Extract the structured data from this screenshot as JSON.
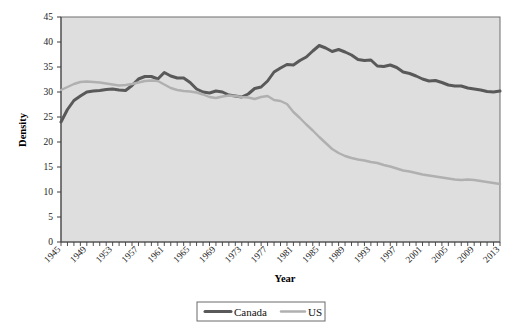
{
  "chart_data": {
    "type": "line",
    "title": "",
    "xlabel": "Year",
    "ylabel": "Density",
    "xlim": [
      1945,
      2013
    ],
    "ylim": [
      0,
      45
    ],
    "yticks": [
      0,
      5,
      10,
      15,
      20,
      25,
      30,
      35,
      40,
      45
    ],
    "xtick_labels": [
      "1945",
      "1949",
      "1953",
      "1957",
      "1961",
      "1965",
      "1969",
      "1973",
      "1977",
      "1981",
      "1985",
      "1989",
      "1993",
      "1997",
      "2001",
      "2005",
      "2009",
      "2013"
    ],
    "xtick_values": [
      1945,
      1949,
      1953,
      1957,
      1961,
      1965,
      1969,
      1973,
      1977,
      1981,
      1985,
      1989,
      1993,
      1997,
      2001,
      2005,
      2009,
      2013
    ],
    "grid": false,
    "legend_position": "bottom",
    "plot_background": "#dedede",
    "x": [
      1945,
      1946,
      1947,
      1948,
      1949,
      1950,
      1951,
      1952,
      1953,
      1954,
      1955,
      1956,
      1957,
      1958,
      1959,
      1960,
      1961,
      1962,
      1963,
      1964,
      1965,
      1966,
      1967,
      1968,
      1969,
      1970,
      1971,
      1972,
      1973,
      1974,
      1975,
      1976,
      1977,
      1978,
      1979,
      1980,
      1981,
      1982,
      1983,
      1984,
      1985,
      1986,
      1987,
      1988,
      1989,
      1990,
      1991,
      1992,
      1993,
      1994,
      1995,
      1996,
      1997,
      1998,
      1999,
      2000,
      2001,
      2002,
      2003,
      2004,
      2005,
      2006,
      2007,
      2008,
      2009,
      2010,
      2011,
      2012,
      2013
    ],
    "series": [
      {
        "name": "Canada",
        "color": "#595959",
        "width": 3.0,
        "values": [
          24.0,
          26.5,
          28.3,
          29.2,
          30.0,
          30.2,
          30.3,
          30.5,
          30.6,
          30.4,
          30.3,
          31.3,
          32.6,
          33.1,
          33.1,
          32.6,
          33.9,
          33.2,
          32.8,
          32.8,
          31.9,
          30.6,
          30.0,
          29.8,
          30.2,
          30.0,
          29.4,
          29.2,
          29.0,
          29.6,
          30.7,
          31.0,
          32.2,
          34.0,
          34.8,
          35.5,
          35.4,
          36.3,
          37.0,
          38.2,
          39.3,
          38.8,
          38.1,
          38.5,
          38.0,
          37.4,
          36.5,
          36.3,
          36.4,
          35.2,
          35.1,
          35.4,
          34.9,
          34.0,
          33.7,
          33.2,
          32.6,
          32.2,
          32.3,
          31.9,
          31.4,
          31.2,
          31.2,
          30.8,
          30.6,
          30.4,
          30.1,
          30.0,
          30.2
        ]
      },
      {
        "name": "US",
        "color": "#b0b0b0",
        "width": 2.4,
        "values": [
          30.4,
          31.0,
          31.6,
          32.0,
          32.1,
          32.0,
          31.9,
          31.7,
          31.5,
          31.3,
          31.4,
          31.6,
          31.9,
          32.2,
          32.3,
          32.2,
          31.5,
          30.8,
          30.4,
          30.2,
          30.1,
          29.9,
          29.5,
          29.0,
          28.8,
          29.1,
          29.3,
          29.2,
          29.0,
          28.9,
          28.6,
          29.0,
          29.2,
          28.4,
          28.2,
          27.6,
          26.0,
          24.8,
          23.5,
          22.3,
          21.0,
          19.8,
          18.6,
          17.8,
          17.2,
          16.8,
          16.5,
          16.3,
          16.0,
          15.8,
          15.4,
          15.1,
          14.7,
          14.3,
          14.1,
          13.8,
          13.5,
          13.3,
          13.1,
          12.9,
          12.7,
          12.5,
          12.4,
          12.5,
          12.4,
          12.2,
          12.0,
          11.8,
          11.6
        ]
      }
    ],
    "legend": [
      {
        "label": "Canada",
        "color": "#595959"
      },
      {
        "label": "US",
        "color": "#b0b0b0"
      }
    ]
  }
}
